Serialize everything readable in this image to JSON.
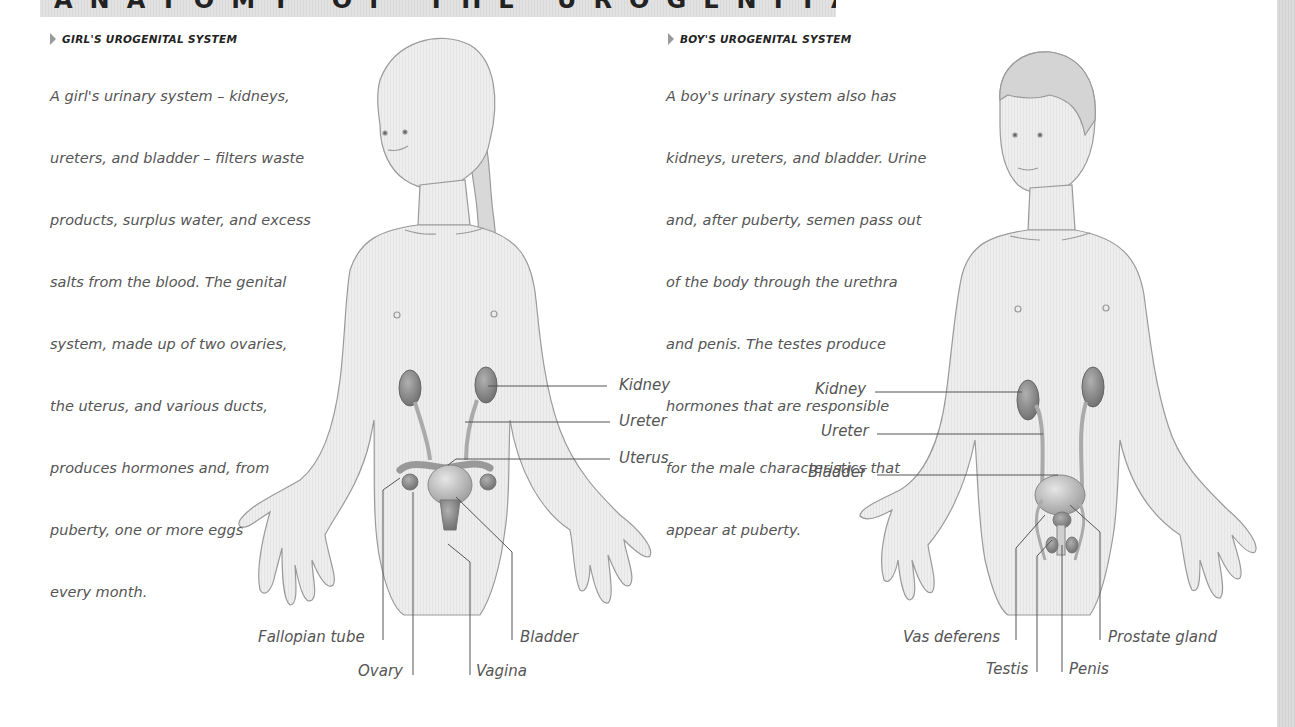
{
  "page": {
    "title": "ANATOMY OF THE UROGENITAL SYSTEM"
  },
  "girl": {
    "heading": "GIRL'S UROGENITAL SYSTEM",
    "lines": [
      "A girl's urinary system – kidneys,",
      "ureters, and bladder – filters waste",
      "products, surplus water, and excess",
      "salts from the blood. The genital",
      "system, made up of two ovaries,",
      "the uterus, and various ducts,",
      "produces hormones and, from",
      "puberty, one or more eggs",
      "every month."
    ],
    "labels": {
      "kidney": "Kidney",
      "ureter": "Ureter",
      "uterus": "Uterus",
      "fallopian_tube": "Fallopian tube",
      "ovary": "Ovary",
      "vagina": "Vagina",
      "bladder": "Bladder"
    }
  },
  "boy": {
    "heading": "BOY'S UROGENITAL SYSTEM",
    "lines": [
      "A boy's urinary system also has",
      "kidneys, ureters, and bladder. Urine",
      "and, after puberty, semen pass out",
      "of the body through the urethra",
      "and penis. The testes produce",
      "hormones that are responsible",
      "for the male characteristics that",
      "appear at puberty."
    ],
    "labels": {
      "kidney": "Kidney",
      "ureter": "Ureter",
      "bladder": "Bladder",
      "vas_deferens": "Vas deferens",
      "testis": "Testis",
      "penis": "Penis",
      "prostate_gland": "Prostate gland"
    }
  },
  "colors": {
    "banner": "#dedede",
    "body_fill": "#ececec",
    "outline": "#9a9a9a",
    "organ": "#8a8a8a",
    "leader_line": "#555555",
    "text": "#555555"
  }
}
